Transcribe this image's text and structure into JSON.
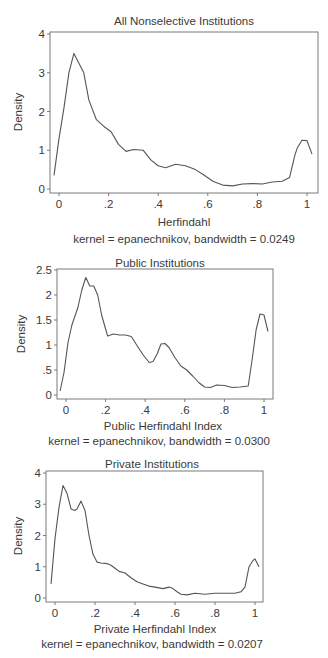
{
  "chart_data": [
    {
      "type": "line",
      "title": "All Nonselective Institutions",
      "xlabel": "Herfindahl",
      "ylabel": "Density",
      "note": "kernel = epanechnikov, bandwidth = 0.0249",
      "xlim": [
        -0.03,
        1.03
      ],
      "ylim": [
        0,
        4
      ],
      "xticks": [
        0,
        0.2,
        0.4,
        0.6,
        0.8,
        1
      ],
      "xtick_labels": [
        "0",
        ".2",
        ".4",
        ".6",
        ".8",
        "1"
      ],
      "yticks": [
        0,
        1,
        2,
        3,
        4
      ],
      "ytick_labels": [
        "0",
        "1",
        "2",
        "3",
        "4"
      ],
      "grid": false,
      "legend": null,
      "series": [
        {
          "name": "kernel density",
          "x": [
            -0.02,
            0.0,
            0.02,
            0.04,
            0.06,
            0.08,
            0.1,
            0.12,
            0.15,
            0.18,
            0.21,
            0.24,
            0.27,
            0.3,
            0.34,
            0.37,
            0.4,
            0.43,
            0.47,
            0.51,
            0.55,
            0.58,
            0.62,
            0.66,
            0.7,
            0.74,
            0.78,
            0.82,
            0.86,
            0.9,
            0.93,
            0.95,
            0.96,
            0.98,
            1.0,
            1.02
          ],
          "y": [
            0.35,
            1.3,
            2.1,
            3.0,
            3.5,
            3.25,
            3.0,
            2.3,
            1.8,
            1.62,
            1.48,
            1.15,
            0.97,
            1.02,
            1.0,
            0.75,
            0.6,
            0.55,
            0.64,
            0.6,
            0.5,
            0.38,
            0.2,
            0.1,
            0.08,
            0.13,
            0.14,
            0.13,
            0.18,
            0.2,
            0.3,
            0.85,
            1.05,
            1.26,
            1.25,
            0.9
          ]
        }
      ]
    },
    {
      "type": "line",
      "title": "Public Institutions",
      "xlabel": "Public Herfindahl Index",
      "ylabel": "Density",
      "note": "kernel = epanechnikov, bandwidth = 0.0300",
      "xlim": [
        -0.03,
        1.03
      ],
      "ylim": [
        0,
        2.5
      ],
      "xticks": [
        0,
        0.2,
        0.4,
        0.6,
        0.8,
        1
      ],
      "xtick_labels": [
        "0",
        ".2",
        ".4",
        ".6",
        ".8",
        "1"
      ],
      "yticks": [
        0,
        0.5,
        1,
        1.5,
        2,
        2.5
      ],
      "ytick_labels": [
        "0",
        ".5",
        "1",
        "1.5",
        "2",
        "2.5"
      ],
      "grid": false,
      "legend": null,
      "series": [
        {
          "name": "kernel density",
          "x": [
            -0.03,
            -0.01,
            0.01,
            0.03,
            0.06,
            0.08,
            0.1,
            0.12,
            0.14,
            0.16,
            0.18,
            0.21,
            0.24,
            0.27,
            0.3,
            0.33,
            0.36,
            0.39,
            0.42,
            0.44,
            0.46,
            0.48,
            0.5,
            0.52,
            0.55,
            0.58,
            0.61,
            0.64,
            0.67,
            0.7,
            0.73,
            0.76,
            0.8,
            0.84,
            0.88,
            0.92,
            0.94,
            0.96,
            0.98,
            1.0,
            1.02
          ],
          "y": [
            0.08,
            0.45,
            1.05,
            1.4,
            1.75,
            2.1,
            2.35,
            2.18,
            2.18,
            2.0,
            1.6,
            1.18,
            1.22,
            1.2,
            1.2,
            1.17,
            0.98,
            0.8,
            0.65,
            0.67,
            0.82,
            1.02,
            1.03,
            0.95,
            0.75,
            0.58,
            0.5,
            0.38,
            0.25,
            0.16,
            0.15,
            0.2,
            0.19,
            0.15,
            0.16,
            0.18,
            0.7,
            1.3,
            1.62,
            1.6,
            1.27
          ]
        }
      ]
    },
    {
      "type": "line",
      "title": "Private Institutions",
      "xlabel": "Private Herfindahl Index",
      "ylabel": "Density",
      "note": "kernel = epanechnikov, bandwidth = 0.0207",
      "xlim": [
        -0.03,
        1.03
      ],
      "ylim": [
        0,
        4
      ],
      "xticks": [
        0,
        0.2,
        0.4,
        0.6,
        0.8,
        1
      ],
      "xtick_labels": [
        "0",
        ".2",
        ".4",
        ".6",
        ".8",
        "1"
      ],
      "yticks": [
        0,
        1,
        2,
        3,
        4
      ],
      "ytick_labels": [
        "0",
        "1",
        "2",
        "3",
        "4"
      ],
      "grid": false,
      "legend": null,
      "series": [
        {
          "name": "kernel density",
          "x": [
            -0.02,
            0.0,
            0.02,
            0.04,
            0.06,
            0.08,
            0.1,
            0.11,
            0.13,
            0.15,
            0.17,
            0.19,
            0.21,
            0.23,
            0.26,
            0.28,
            0.3,
            0.32,
            0.35,
            0.38,
            0.41,
            0.44,
            0.47,
            0.5,
            0.54,
            0.57,
            0.59,
            0.61,
            0.63,
            0.66,
            0.7,
            0.75,
            0.8,
            0.85,
            0.9,
            0.93,
            0.95,
            0.97,
            0.99,
            1.0,
            1.02
          ],
          "y": [
            0.45,
            1.9,
            2.9,
            3.6,
            3.35,
            2.85,
            2.8,
            2.85,
            3.1,
            2.8,
            2.0,
            1.4,
            1.15,
            1.12,
            1.1,
            1.05,
            0.95,
            0.85,
            0.8,
            0.65,
            0.52,
            0.45,
            0.38,
            0.35,
            0.3,
            0.35,
            0.3,
            0.2,
            0.12,
            0.1,
            0.15,
            0.12,
            0.15,
            0.15,
            0.15,
            0.2,
            0.35,
            1.0,
            1.2,
            1.25,
            1.0
          ]
        }
      ]
    }
  ],
  "layout": {
    "panels": [
      {
        "frame": {
          "left": 50,
          "top": 32,
          "right": 318,
          "bottom": 193
        },
        "x0px": 59,
        "x1px": 307,
        "y0px": 189,
        "ytopPx": 34,
        "title_y": 25,
        "ylabel_x": 22,
        "tick_label_y": 208,
        "xlabel_y": 226,
        "note_y": 243
      },
      {
        "frame": {
          "left": 57,
          "top": 269,
          "right": 273,
          "bottom": 399
        },
        "x0px": 66,
        "x1px": 264,
        "y0px": 395,
        "ytopPx": 270,
        "title_y": 267,
        "ylabel_x": 25,
        "tick_label_y": 414,
        "xlabel_y": 430,
        "note_y": 445
      },
      {
        "frame": {
          "left": 46,
          "top": 471,
          "right": 263,
          "bottom": 602
        },
        "x0px": 55,
        "x1px": 255,
        "y0px": 598,
        "ytopPx": 473,
        "title_y": 468,
        "ylabel_x": 22,
        "tick_label_y": 617,
        "xlabel_y": 633,
        "note_y": 648
      }
    ],
    "line_color": "#555555",
    "frame_color": "#7a7a7a",
    "text_color": "#3a3a3a"
  }
}
